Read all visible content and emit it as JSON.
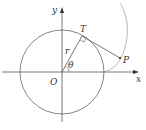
{
  "diagram": {
    "labels": {
      "y_axis": "y",
      "x_axis": "x",
      "origin": "O",
      "tangent_point": "T",
      "point": "P",
      "radius": "r",
      "angle": "θ"
    },
    "colors": {
      "stroke": "#555555",
      "curve": "#888888",
      "text": "#333333"
    }
  }
}
